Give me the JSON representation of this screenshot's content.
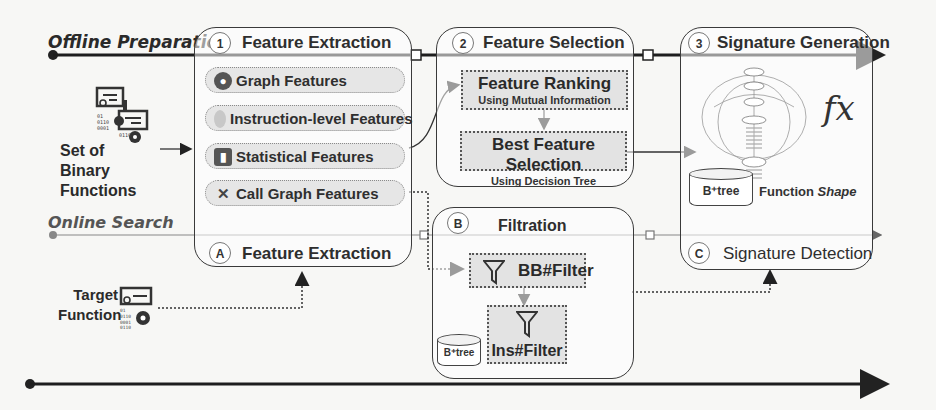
{
  "lanes": {
    "offline": "Offline Preparation",
    "online": "Online Search"
  },
  "inputs": {
    "binary_set": [
      "Set of",
      "Binary",
      "Functions"
    ],
    "target": [
      "Target",
      "Function"
    ]
  },
  "panel1": {
    "step": "1",
    "title": "Feature Extraction",
    "features": [
      {
        "label": "Graph Features",
        "icon": "graph-icon"
      },
      {
        "label": "Instruction-level Features",
        "icon": "fingerprint-icon"
      },
      {
        "label": "Statistical Features",
        "icon": "statistics-icon"
      },
      {
        "label": "Call Graph Features",
        "icon": "call-graph-icon"
      }
    ],
    "online_step": "A",
    "online_title": "Feature Extraction"
  },
  "panel2": {
    "step": "2",
    "title": "Feature Selection",
    "ranking": {
      "title": "Feature Ranking",
      "subtitle": "Using Mutual Information"
    },
    "best": {
      "title": "Best Feature Selection",
      "subtitle": "Using Decision Tree"
    }
  },
  "panel3": {
    "step": "3",
    "title": "Signature Generation",
    "fx": "fx",
    "btree": "B⁺tree",
    "shape_label": "Function",
    "shape_label_italic": "Shape",
    "online_step": "C",
    "online_title": "Signature Detection"
  },
  "panelB": {
    "step": "B",
    "title": "Filtration",
    "bb_filter": "BB#Filter",
    "ins_filter": "Ins#Filter",
    "btree": "B⁺tree"
  }
}
